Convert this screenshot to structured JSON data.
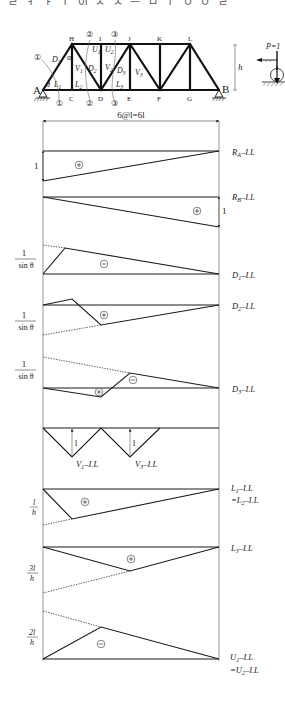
{
  "header_clipped_text": "ㄹ ㅓ ㅏ ㅣ 이 ㅅ ㅅ ㅡ ㅁ ㅣ ㅇ ㅇ ㄹ",
  "truss": {
    "nodes_bottom": [
      {
        "id": "A",
        "x": 43,
        "y": 90
      },
      {
        "id": "C",
        "x": 72,
        "y": 90
      },
      {
        "id": "D",
        "x": 101,
        "y": 90
      },
      {
        "id": "E",
        "x": 130,
        "y": 90
      },
      {
        "id": "F",
        "x": 160,
        "y": 90
      },
      {
        "id": "G",
        "x": 190,
        "y": 90
      },
      {
        "id": "B",
        "x": 219,
        "y": 90
      }
    ],
    "nodes_top": [
      {
        "id": "H",
        "x": 72,
        "y": 44
      },
      {
        "id": "I",
        "x": 101,
        "y": 44
      },
      {
        "id": "J",
        "x": 130,
        "y": 44
      },
      {
        "id": "K",
        "x": 160,
        "y": 44
      },
      {
        "id": "L",
        "x": 190,
        "y": 44
      }
    ],
    "members": [
      [
        43,
        90,
        219,
        90
      ],
      [
        72,
        44,
        190,
        44
      ],
      [
        43,
        90,
        72,
        44
      ],
      [
        72,
        44,
        72,
        90
      ],
      [
        72,
        44,
        101,
        90
      ],
      [
        101,
        44,
        101,
        90
      ],
      [
        101,
        90,
        130,
        44
      ],
      [
        130,
        44,
        130,
        90
      ],
      [
        130,
        44,
        160,
        90
      ],
      [
        160,
        44,
        160,
        90
      ],
      [
        160,
        90,
        190,
        44
      ],
      [
        190,
        44,
        190,
        90
      ],
      [
        190,
        44,
        219,
        90
      ]
    ],
    "member_labels": [
      {
        "t": "D",
        "sub": "1",
        "x": 52,
        "y": 62
      },
      {
        "t": "α",
        "sub": "",
        "x": 67,
        "y": 60
      },
      {
        "t": "V",
        "sub": "1",
        "x": 75,
        "y": 71
      },
      {
        "t": "D",
        "sub": "2",
        "x": 88,
        "y": 71
      },
      {
        "t": "U",
        "sub": "1",
        "x": 92,
        "y": 52
      },
      {
        "t": "U",
        "sub": "2",
        "x": 105,
        "y": 52
      },
      {
        "t": "V",
        "sub": "2",
        "x": 105,
        "y": 70
      },
      {
        "t": "D",
        "sub": "3",
        "x": 117,
        "y": 73
      },
      {
        "t": "V",
        "sub": "3",
        "x": 135,
        "y": 75
      },
      {
        "t": "θ",
        "sub": "",
        "x": 46,
        "y": 87
      },
      {
        "t": "L",
        "sub": "1",
        "x": 54,
        "y": 87
      },
      {
        "t": "L",
        "sub": "2",
        "x": 75,
        "y": 87
      },
      {
        "t": "L",
        "sub": "3",
        "x": 116,
        "y": 87
      }
    ],
    "section_marks": [
      {
        "label": "①",
        "x": 37,
        "y": 60
      },
      {
        "label": "①",
        "x": 59,
        "y": 106
      },
      {
        "label": "②",
        "x": 89,
        "y": 37
      },
      {
        "label": "②",
        "x": 89,
        "y": 106
      },
      {
        "label": "③",
        "x": 114,
        "y": 37
      },
      {
        "label": "③",
        "x": 114,
        "y": 106
      }
    ],
    "height_label": "h",
    "load_label": "P=1"
  },
  "dimension": {
    "label": "6@l=6l",
    "x1": 43,
    "x2": 219,
    "y": 121
  },
  "chart_data": {
    "type": "line",
    "x_span": "6@l=6l",
    "panel_points_x": [
      0,
      1,
      2,
      3,
      4,
      5,
      6
    ],
    "series": [
      {
        "name": "R_A-I.L",
        "label": "R",
        "sub": "A",
        "suffix": "-I.L",
        "baseline_y": 151,
        "label_y": 152,
        "solid": [
          [
            43,
            151
          ],
          [
            219,
            151
          ],
          [
            43,
            181
          ]
        ],
        "closed_solid": [
          [
            43,
            181
          ],
          [
            219,
            151
          ]
        ],
        "dotted": [],
        "sign": "+",
        "sign_x": 79,
        "sign_y": 165,
        "left_value": "1",
        "ordinates": [
          1,
          0.833,
          0.667,
          0.5,
          0.333,
          0.167,
          0
        ]
      },
      {
        "name": "R_B-I.L",
        "label": "R",
        "sub": "B",
        "suffix": "-I.L",
        "baseline_y": 197,
        "label_y": 197,
        "poly": [
          [
            43,
            197
          ],
          [
            219,
            227
          ]
        ],
        "dotted": [],
        "sign": "+",
        "sign_x": 197,
        "sign_y": 211,
        "right_value": "1",
        "ordinates": [
          0,
          0.167,
          0.333,
          0.5,
          0.667,
          0.833,
          1
        ]
      },
      {
        "name": "D1-I.L",
        "label": "D",
        "sub": "1",
        "suffix": "-I.L",
        "baseline_y": 274,
        "label_y": 275,
        "poly": [
          [
            43,
            274
          ],
          [
            65,
            248
          ],
          [
            219,
            274
          ]
        ],
        "dotted": [
          [
            43,
            245
          ],
          [
            65,
            248
          ]
        ],
        "sign": "−",
        "sign_x": 104,
        "sign_y": 264,
        "left_value": "1/sinθ",
        "ordinates_sign": "negative"
      },
      {
        "name": "D2-I.L",
        "label": "D",
        "sub": "2",
        "suffix": "-I.L",
        "baseline_y": 305,
        "label_y": 306,
        "poly": [
          [
            43,
            305
          ],
          [
            72,
            299
          ],
          [
            101,
            325
          ],
          [
            219,
            305
          ]
        ],
        "dotted": [
          [
            43,
            335
          ],
          [
            101,
            325
          ]
        ],
        "sign": "+",
        "sign_x": 104,
        "sign_y": 315,
        "left_value": "1/sinθ"
      },
      {
        "name": "D3-I.L",
        "label": "D",
        "sub": "3",
        "suffix": "-I.L",
        "baseline_y": 388,
        "label_y": 389,
        "poly": [
          [
            43,
            388
          ],
          [
            101,
            397
          ],
          [
            130,
            373
          ],
          [
            219,
            388
          ]
        ],
        "dotted": [
          [
            43,
            357
          ],
          [
            130,
            373
          ]
        ],
        "signs": [
          {
            "s": "+",
            "x": 99,
            "y": 392
          },
          {
            "s": "−",
            "x": 133,
            "y": 380
          }
        ],
        "left_value": "1/sinθ"
      },
      {
        "name": "V-I.L",
        "baseline_y": 428,
        "poly": [
          [
            43,
            428
          ],
          [
            72,
            457
          ],
          [
            101,
            428
          ],
          [
            130,
            457
          ],
          [
            160,
            428
          ]
        ],
        "arrows": [
          {
            "x": 72,
            "y1": 457,
            "y2": 428,
            "label": "1"
          },
          {
            "x": 130,
            "y1": 457,
            "y2": 428,
            "label": "1"
          }
        ],
        "labels": [
          {
            "label": "V",
            "sub": "1",
            "suffix": "-I.L",
            "x": 77,
            "y": 466
          },
          {
            "label": "V",
            "sub": "3",
            "suffix": "-I.L",
            "x": 135,
            "y": 466
          }
        ]
      },
      {
        "name": "L1-I.L = L2-I.L",
        "label": "L",
        "sub": "1",
        "suffix": "-I.L",
        "label2": "=L",
        "sub2": "2",
        "suffix2": "-I.L",
        "baseline_y": 489,
        "label_y": 489,
        "poly": [
          [
            43,
            489
          ],
          [
            72,
            519
          ],
          [
            219,
            489
          ]
        ],
        "dotted": [
          [
            43,
            525
          ],
          [
            72,
            519
          ]
        ],
        "sign": "+",
        "sign_x": 85,
        "sign_y": 502,
        "left_value": "l/h"
      },
      {
        "name": "L3-I.L",
        "label": "L",
        "sub": "3",
        "suffix": "-I.L",
        "baseline_y": 547,
        "label_y": 548,
        "poly": [
          [
            43,
            547
          ],
          [
            130,
            571
          ],
          [
            219,
            547
          ]
        ],
        "dotted": [
          [
            43,
            593
          ],
          [
            130,
            571
          ]
        ],
        "sign": "+",
        "sign_x": 131,
        "sign_y": 559,
        "left_value": "3l/h"
      },
      {
        "name": "U1-I.L = U2-I.L",
        "label": "U",
        "sub": "1",
        "suffix": "-I.L",
        "label2": "=U",
        "sub2": "2",
        "suffix2": "-I.L",
        "baseline_y": 659,
        "label_y": 660,
        "poly": [
          [
            43,
            659
          ],
          [
            101,
            627
          ],
          [
            219,
            659
          ]
        ],
        "dotted": [
          [
            43,
            611
          ],
          [
            101,
            627
          ]
        ],
        "sign": "−",
        "sign_x": 101,
        "sign_y": 644,
        "left_value": "2l/h"
      }
    ],
    "colors": {
      "line": "#1a1a1a",
      "frame": "#8a8a8a",
      "dotted": "#333333"
    }
  },
  "left_values": {
    "ra_one": "1",
    "rb_one": "1",
    "d1_num": "1",
    "d1_den": "sin θ",
    "d2_num": "1",
    "d2_den": "sin θ",
    "d3_num": "1",
    "d3_den": "sin θ",
    "l1_num": "l",
    "l1_den": "h",
    "l3_num": "3l",
    "l3_den": "h",
    "u1_num": "2l",
    "u1_den": "h",
    "v1_one": "1",
    "v3_one": "1"
  },
  "labels": {
    "ra": {
      "main": "R",
      "sub": "A",
      "suffix": "–I.L"
    },
    "rb": {
      "main": "R",
      "sub": "B",
      "suffix": "–I.L"
    },
    "d1": {
      "main": "D",
      "sub": "1",
      "suffix": "–I.L"
    },
    "d2": {
      "main": "D",
      "sub": "2",
      "suffix": "–I.L"
    },
    "d3": {
      "main": "D",
      "sub": "3",
      "suffix": "–I.L"
    },
    "v1": {
      "main": "V",
      "sub": "1",
      "suffix": "–I.L"
    },
    "v3": {
      "main": "V",
      "sub": "3",
      "suffix": "–I.L"
    },
    "l1": {
      "main": "L",
      "sub": "1",
      "suffix": "–I.L"
    },
    "l2": {
      "main": "=L",
      "sub": "2",
      "suffix": "–I.L"
    },
    "l3": {
      "main": "L",
      "sub": "3",
      "suffix": "–I.L"
    },
    "u1": {
      "main": "U",
      "sub": "1",
      "suffix": "–I.L"
    },
    "u2": {
      "main": "=U",
      "sub": "2",
      "suffix": "–I.L"
    }
  },
  "signs": {
    "plus": "+",
    "minus": "−"
  },
  "node_labels": {
    "A": "A",
    "B": "B",
    "C": "C",
    "D": "D",
    "E": "E",
    "F": "F",
    "G": "G",
    "H": "H",
    "I": "I",
    "J": "J",
    "K": "K",
    "L": "L"
  }
}
